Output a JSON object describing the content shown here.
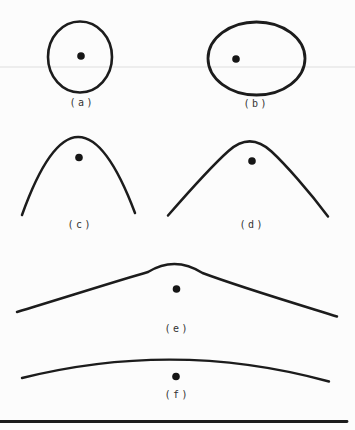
{
  "figure": {
    "type": "line-diagram",
    "ink_color": "#1c1c1c",
    "label_color": "#333333",
    "background_color": "#fcfcfc",
    "panels": [
      {
        "id": "a",
        "label": "(a)",
        "shape": "closed-circle-with-dot"
      },
      {
        "id": "b",
        "label": "(b)",
        "shape": "closed-ellipse-with-dot"
      },
      {
        "id": "c",
        "label": "(c)",
        "shape": "narrow-arch-with-dot"
      },
      {
        "id": "d",
        "label": "(d)",
        "shape": "wide-arch-with-dot"
      },
      {
        "id": "e",
        "label": "(e)",
        "shape": "broad-shallow-arch-with-dot"
      },
      {
        "id": "f",
        "label": "(f)",
        "shape": "near-flat-arc-with-dot"
      }
    ]
  }
}
